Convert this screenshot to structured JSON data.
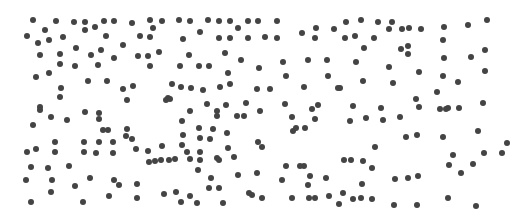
{
  "figure": {
    "width": 512,
    "height": 219,
    "background": "#ffffff",
    "dot_color": "#444444",
    "dot_diameter": 6,
    "dots": [
      [
        33,
        20
      ],
      [
        56,
        21
      ],
      [
        74,
        22
      ],
      [
        85,
        22
      ],
      [
        104,
        21
      ],
      [
        114,
        21
      ],
      [
        132,
        23
      ],
      [
        150,
        20
      ],
      [
        162,
        21
      ],
      [
        45,
        30
      ],
      [
        85,
        30
      ],
      [
        95,
        27
      ],
      [
        153,
        28
      ],
      [
        27,
        36
      ],
      [
        38,
        43
      ],
      [
        49,
        40
      ],
      [
        63,
        37
      ],
      [
        106,
        36
      ],
      [
        123,
        45
      ],
      [
        140,
        36
      ],
      [
        150,
        37
      ],
      [
        40,
        55
      ],
      [
        60,
        54
      ],
      [
        76,
        48
      ],
      [
        91,
        55
      ],
      [
        101,
        50
      ],
      [
        114,
        58
      ],
      [
        138,
        56
      ],
      [
        148,
        56
      ],
      [
        159,
        52
      ],
      [
        36,
        77
      ],
      [
        49,
        73
      ],
      [
        60,
        64
      ],
      [
        75,
        66
      ],
      [
        98,
        65
      ],
      [
        150,
        66
      ],
      [
        168,
        98
      ],
      [
        61,
        88
      ],
      [
        88,
        81
      ],
      [
        107,
        81
      ],
      [
        133,
        86
      ],
      [
        166,
        100
      ],
      [
        40,
        107
      ],
      [
        60,
        97
      ],
      [
        127,
        100
      ],
      [
        40,
        110
      ],
      [
        123,
        89
      ],
      [
        179,
        20
      ],
      [
        190,
        21
      ],
      [
        208,
        20
      ],
      [
        219,
        21
      ],
      [
        230,
        21
      ],
      [
        238,
        28
      ],
      [
        248,
        21
      ],
      [
        258,
        21
      ],
      [
        277,
        21
      ],
      [
        200,
        32
      ],
      [
        183,
        39
      ],
      [
        219,
        38
      ],
      [
        230,
        38
      ],
      [
        248,
        38
      ],
      [
        265,
        37
      ],
      [
        277,
        38
      ],
      [
        302,
        33
      ],
      [
        316,
        28
      ],
      [
        334,
        29
      ],
      [
        315,
        38
      ],
      [
        189,
        55
      ],
      [
        225,
        53
      ],
      [
        241,
        60
      ],
      [
        180,
        66
      ],
      [
        199,
        66
      ],
      [
        209,
        66
      ],
      [
        228,
        73
      ],
      [
        259,
        68
      ],
      [
        283,
        62
      ],
      [
        286,
        76
      ],
      [
        308,
        60
      ],
      [
        327,
        60
      ],
      [
        328,
        76
      ],
      [
        172,
        84
      ],
      [
        181,
        87
      ],
      [
        191,
        88
      ],
      [
        203,
        90
      ],
      [
        220,
        87
      ],
      [
        230,
        84
      ],
      [
        257,
        89
      ],
      [
        270,
        89
      ],
      [
        304,
        87
      ],
      [
        338,
        88
      ],
      [
        170,
        99
      ],
      [
        207,
        104
      ],
      [
        226,
        105
      ],
      [
        246,
        103
      ],
      [
        285,
        104
      ],
      [
        318,
        105
      ],
      [
        346,
        22
      ],
      [
        361,
        20
      ],
      [
        378,
        22
      ],
      [
        389,
        29
      ],
      [
        392,
        22
      ],
      [
        402,
        29
      ],
      [
        409,
        28
      ],
      [
        421,
        29
      ],
      [
        444,
        27
      ],
      [
        468,
        25
      ],
      [
        487,
        20
      ],
      [
        345,
        38
      ],
      [
        355,
        36
      ],
      [
        374,
        38
      ],
      [
        364,
        48
      ],
      [
        401,
        49
      ],
      [
        408,
        46
      ],
      [
        408,
        54
      ],
      [
        443,
        40
      ],
      [
        444,
        58
      ],
      [
        471,
        57
      ],
      [
        485,
        50
      ],
      [
        356,
        62
      ],
      [
        389,
        67
      ],
      [
        419,
        72
      ],
      [
        443,
        76
      ],
      [
        485,
        71
      ],
      [
        363,
        81
      ],
      [
        393,
        83
      ],
      [
        458,
        82
      ],
      [
        340,
        88
      ],
      [
        437,
        92
      ],
      [
        416,
        99
      ],
      [
        353,
        106
      ],
      [
        381,
        108
      ],
      [
        440,
        109
      ],
      [
        448,
        108
      ],
      [
        459,
        108
      ],
      [
        483,
        103
      ],
      [
        40,
        107
      ],
      [
        33,
        125
      ],
      [
        51,
        117
      ],
      [
        67,
        120
      ],
      [
        85,
        112
      ],
      [
        99,
        113
      ],
      [
        99,
        119
      ],
      [
        103,
        130
      ],
      [
        108,
        130
      ],
      [
        126,
        136
      ],
      [
        127,
        129
      ],
      [
        132,
        139
      ],
      [
        27,
        152
      ],
      [
        36,
        149
      ],
      [
        55,
        142
      ],
      [
        55,
        152
      ],
      [
        84,
        142
      ],
      [
        84,
        152
      ],
      [
        96,
        153
      ],
      [
        99,
        142
      ],
      [
        113,
        142
      ],
      [
        113,
        153
      ],
      [
        136,
        149
      ],
      [
        162,
        146
      ],
      [
        161,
        160
      ],
      [
        155,
        161
      ],
      [
        149,
        162
      ],
      [
        148,
        151
      ],
      [
        31,
        167
      ],
      [
        48,
        168
      ],
      [
        69,
        166
      ],
      [
        26,
        180
      ],
      [
        52,
        180
      ],
      [
        75,
        186
      ],
      [
        90,
        178
      ],
      [
        114,
        180
      ],
      [
        119,
        185
      ],
      [
        137,
        184
      ],
      [
        51,
        192
      ],
      [
        31,
        202
      ],
      [
        83,
        202
      ],
      [
        109,
        196
      ],
      [
        137,
        198
      ],
      [
        164,
        194
      ],
      [
        190,
        111
      ],
      [
        217,
        111
      ],
      [
        260,
        111
      ],
      [
        312,
        109
      ],
      [
        182,
        121
      ],
      [
        199,
        128
      ],
      [
        217,
        116
      ],
      [
        237,
        116
      ],
      [
        244,
        116
      ],
      [
        183,
        135
      ],
      [
        200,
        138
      ],
      [
        213,
        129
      ],
      [
        227,
        133
      ],
      [
        237,
        116
      ],
      [
        293,
        131
      ],
      [
        292,
        117
      ],
      [
        296,
        128
      ],
      [
        305,
        128
      ],
      [
        315,
        119
      ],
      [
        182,
        145
      ],
      [
        187,
        152
      ],
      [
        200,
        152
      ],
      [
        210,
        139
      ],
      [
        217,
        158
      ],
      [
        228,
        148
      ],
      [
        258,
        142
      ],
      [
        262,
        147
      ],
      [
        175,
        159
      ],
      [
        190,
        159
      ],
      [
        200,
        160
      ],
      [
        219,
        160
      ],
      [
        234,
        157
      ],
      [
        169,
        160
      ],
      [
        286,
        166
      ],
      [
        304,
        166
      ],
      [
        198,
        170
      ],
      [
        211,
        178
      ],
      [
        238,
        175
      ],
      [
        257,
        173
      ],
      [
        282,
        180
      ],
      [
        300,
        166
      ],
      [
        310,
        176
      ],
      [
        308,
        185
      ],
      [
        326,
        178
      ],
      [
        176,
        192
      ],
      [
        209,
        188
      ],
      [
        219,
        188
      ],
      [
        252,
        195
      ],
      [
        181,
        202
      ],
      [
        190,
        196
      ],
      [
        197,
        203
      ],
      [
        223,
        203
      ],
      [
        249,
        193
      ],
      [
        262,
        198
      ],
      [
        292,
        198
      ],
      [
        309,
        198
      ],
      [
        315,
        198
      ],
      [
        329,
        196
      ],
      [
        339,
        204
      ],
      [
        353,
        106
      ],
      [
        350,
        121
      ],
      [
        366,
        118
      ],
      [
        383,
        120
      ],
      [
        400,
        117
      ],
      [
        419,
        107
      ],
      [
        446,
        109
      ],
      [
        375,
        147
      ],
      [
        417,
        135
      ],
      [
        406,
        137
      ],
      [
        443,
        137
      ],
      [
        478,
        131
      ],
      [
        453,
        155
      ],
      [
        484,
        153
      ],
      [
        502,
        153
      ],
      [
        344,
        160
      ],
      [
        351,
        160
      ],
      [
        363,
        161
      ],
      [
        372,
        168
      ],
      [
        395,
        179
      ],
      [
        408,
        178
      ],
      [
        418,
        176
      ],
      [
        449,
        165
      ],
      [
        473,
        164
      ],
      [
        461,
        173
      ],
      [
        507,
        143
      ],
      [
        362,
        184
      ],
      [
        343,
        193
      ],
      [
        353,
        199
      ],
      [
        361,
        198
      ],
      [
        372,
        199
      ],
      [
        394,
        205
      ],
      [
        417,
        205
      ],
      [
        448,
        198
      ],
      [
        476,
        206
      ]
    ]
  }
}
